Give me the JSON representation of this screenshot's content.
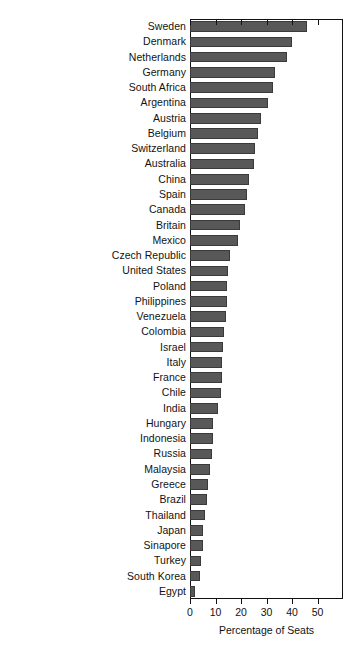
{
  "chart_data": {
    "type": "bar",
    "orientation": "horizontal",
    "title": "",
    "subtitle": "",
    "xlabel": "Percentage of Seats",
    "ylabel": "",
    "xlim": [
      0,
      60
    ],
    "xticks": [
      0,
      10,
      20,
      30,
      40,
      50
    ],
    "xtick_labels": [
      "0",
      "10",
      "20",
      "30",
      "40",
      "50"
    ],
    "grid": false,
    "legend": null,
    "bar_color": "#585858",
    "frame_color": "#111111",
    "categories": [
      "Sweden",
      "Denmark",
      "Netherlands",
      "Germany",
      "South Africa",
      "Argentina",
      "Austria",
      "Belgium",
      "Switzerland",
      "Australia",
      "China",
      "Spain",
      "Canada",
      "Britain",
      "Mexico",
      "Czech Republic",
      "United States",
      "Poland",
      "Philippines",
      "Venezuela",
      "Colombia",
      "Israel",
      "Italy",
      "France",
      "Chile",
      "India",
      "Hungary",
      "Indonesia",
      "Russia",
      "Malaysia",
      "Greece",
      "Brazil",
      "Thailand",
      "Japan",
      "Sinapore",
      "Turkey",
      "South Korea",
      "Egypt"
    ],
    "values": [
      46,
      40,
      38,
      33.5,
      32.5,
      30.5,
      28,
      26.5,
      25.5,
      25,
      23,
      22.5,
      21.5,
      19.5,
      19,
      15.5,
      15,
      14.5,
      14.5,
      14,
      13.5,
      13,
      12.5,
      12.5,
      12,
      11,
      9,
      9,
      8.5,
      8,
      7,
      6.5,
      6,
      5,
      5,
      4.5,
      4,
      2
    ],
    "series": [
      {
        "name": "Percentage of Seats",
        "values": [
          46,
          40,
          38,
          33.5,
          32.5,
          30.5,
          28,
          26.5,
          25.5,
          25,
          23,
          22.5,
          21.5,
          19.5,
          19,
          15.5,
          15,
          14.5,
          14.5,
          14,
          13.5,
          13,
          12.5,
          12.5,
          12,
          11,
          9,
          9,
          8.5,
          8,
          7,
          6.5,
          6,
          5,
          5,
          4.5,
          4,
          2
        ]
      }
    ]
  }
}
